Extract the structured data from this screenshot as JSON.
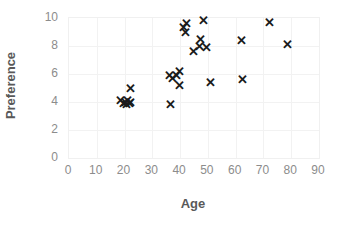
{
  "chart_data": {
    "type": "scatter",
    "title": "",
    "xlabel": "Age",
    "ylabel": "Preference",
    "xlim": [
      0,
      90
    ],
    "ylim": [
      0,
      10
    ],
    "xticks": [
      0,
      10,
      20,
      30,
      40,
      50,
      60,
      70,
      80,
      90
    ],
    "yticks": [
      0,
      2,
      4,
      6,
      8,
      10
    ],
    "grid": true,
    "legend": false,
    "marker": "x",
    "marker_color": "#1a1a1a",
    "series": [
      {
        "name": "respondents",
        "points": [
          [
            18.5,
            4.1
          ],
          [
            19.5,
            3.9
          ],
          [
            20.3,
            4.0
          ],
          [
            20.6,
            3.8
          ],
          [
            21.2,
            4.1
          ],
          [
            21.6,
            3.9
          ],
          [
            22.0,
            4.0
          ],
          [
            22.3,
            5.0
          ],
          [
            36.0,
            5.9
          ],
          [
            36.6,
            3.8
          ],
          [
            37.2,
            5.7
          ],
          [
            38.6,
            5.9
          ],
          [
            39.6,
            6.2
          ],
          [
            39.8,
            5.2
          ],
          [
            41.3,
            9.3
          ],
          [
            42.0,
            9.0
          ],
          [
            42.3,
            9.6
          ],
          [
            44.8,
            7.6
          ],
          [
            46.8,
            8.0
          ],
          [
            47.4,
            8.5
          ],
          [
            48.4,
            9.8
          ],
          [
            49.6,
            7.9
          ],
          [
            51.0,
            5.4
          ],
          [
            62.0,
            8.4
          ],
          [
            62.4,
            5.6
          ],
          [
            72.0,
            9.7
          ],
          [
            78.8,
            8.1
          ]
        ]
      }
    ]
  }
}
